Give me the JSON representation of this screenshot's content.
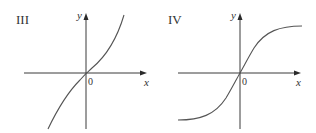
{
  "figure": {
    "panels": [
      {
        "id": "III",
        "label": "III",
        "x_axis_label": "x",
        "y_axis_label": "y",
        "origin_label": "0",
        "curve_description": "increasing odd function, concave down for x<0 and concave up for x>0 (cubic-like), passing through origin"
      },
      {
        "id": "IV",
        "label": "IV",
        "x_axis_label": "x",
        "y_axis_label": "y",
        "origin_label": "0",
        "curve_description": "increasing odd function, S-shaped (sigmoid/arctan-like) with horizontal asymptotes, passing through origin"
      }
    ]
  },
  "colors": {
    "axis": "#3a3a3a",
    "curve": "#555555",
    "text": "#333333",
    "background": "#ffffff"
  }
}
